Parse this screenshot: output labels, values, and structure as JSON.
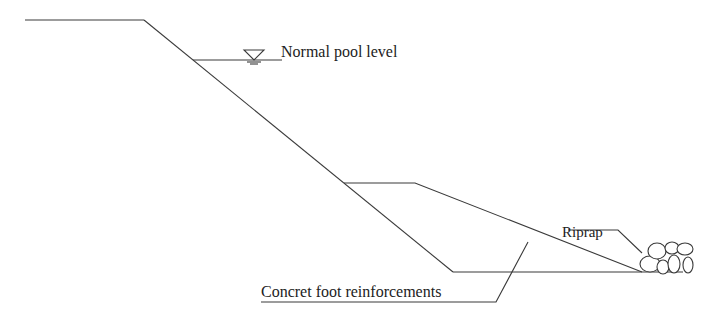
{
  "diagram": {
    "type": "embankment cross-section",
    "labels": {
      "normal_pool_level": "Normal pool level",
      "riprap": "Riprap",
      "concrete_foot": "Concret foot reinforcements"
    },
    "symbols": {
      "water_level": "inverted-triangle-water-level-symbol"
    },
    "colors": {
      "line": "#3a3a3a",
      "text": "#222222",
      "background": "#ffffff"
    }
  }
}
